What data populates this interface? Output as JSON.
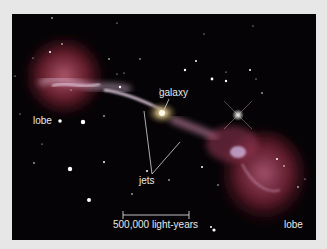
{
  "figure": {
    "labels": {
      "lobe_left": "lobe",
      "galaxy": "galaxy",
      "jets": "jets",
      "lobe_right": "lobe",
      "scale_bar": "500,000 light-years"
    },
    "colors": {
      "background": "#e6e7e6",
      "space": "#050305",
      "lobe": "#8a2a3c",
      "lobe_highlight": "#e6b8d8",
      "label_text": "#e8e8e8"
    }
  }
}
